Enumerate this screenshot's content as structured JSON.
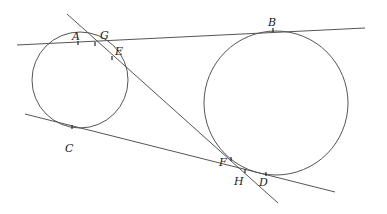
{
  "diagram": {
    "type": "geometry",
    "colors": {
      "stroke": "#555555",
      "label": "#222222",
      "background": "#ffffff"
    },
    "circles": [
      {
        "id": "small",
        "cx": 80,
        "cy": 80,
        "r": 48
      },
      {
        "id": "large",
        "cx": 276,
        "cy": 103,
        "r": 72
      }
    ],
    "lines": [
      {
        "id": "top-tangent",
        "x1": 17,
        "y1": 45,
        "x2": 365,
        "y2": 28
      },
      {
        "id": "bottom-tangent",
        "x1": 25,
        "y1": 114,
        "x2": 335,
        "y2": 192
      },
      {
        "id": "transversal",
        "x1": 67,
        "y1": 14,
        "x2": 278,
        "y2": 203
      }
    ],
    "points": [
      {
        "name": "A",
        "x": 78,
        "y": 43,
        "lx": 72,
        "ly": 40
      },
      {
        "name": "G",
        "x": 95,
        "y": 44,
        "lx": 100,
        "ly": 39
      },
      {
        "name": "E",
        "x": 112,
        "y": 58,
        "lx": 115,
        "ly": 55
      },
      {
        "name": "B",
        "x": 273,
        "y": 30,
        "lx": 268,
        "ly": 26
      },
      {
        "name": "C",
        "x": 72,
        "y": 127,
        "lx": 65,
        "ly": 152
      },
      {
        "name": "F",
        "x": 231,
        "y": 159,
        "lx": 219,
        "ly": 166
      },
      {
        "name": "H",
        "x": 245,
        "y": 171,
        "lx": 234,
        "ly": 185
      },
      {
        "name": "D",
        "x": 266,
        "y": 174,
        "lx": 259,
        "ly": 186
      }
    ]
  }
}
